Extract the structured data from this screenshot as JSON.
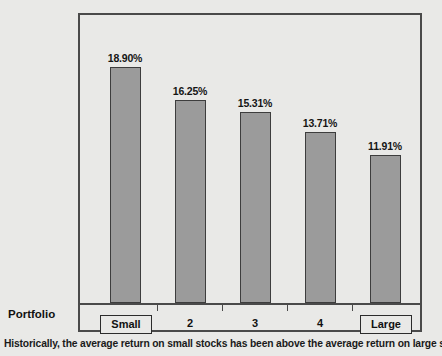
{
  "chart_data": {
    "type": "bar",
    "title": "",
    "subtitle": "",
    "xlabel": "Portfolio",
    "ylabel": "",
    "categories": [
      "Small",
      "2",
      "3",
      "4",
      "Large"
    ],
    "values": [
      18.9,
      16.25,
      15.31,
      13.71,
      11.91
    ],
    "value_labels": [
      "18.90%",
      "16.25%",
      "15.31%",
      "13.71%",
      "11.91%"
    ],
    "ylim": [
      0,
      21.5
    ],
    "grid": false,
    "legend": null,
    "series": [
      {
        "name": "Average annual return",
        "values": [
          18.9,
          16.25,
          15.31,
          13.71,
          11.91
        ]
      }
    ],
    "boxed_categories": [
      "Small",
      "Large"
    ],
    "colors": {
      "bar_fill": "#9b9b9b",
      "bar_border": "#3d3d3d",
      "frame": "#4a4a4a",
      "background": "#e9e9e7",
      "text": "#111111"
    }
  },
  "axis": {
    "title": "Portfolio"
  },
  "caption": {
    "text": "Historically, the average return on small stocks has been above the average return on large stocks."
  }
}
